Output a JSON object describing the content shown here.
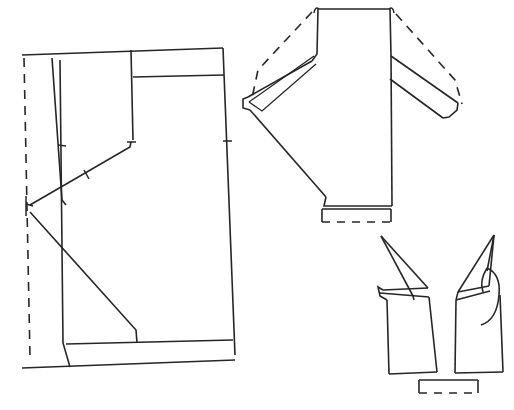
{
  "document": {
    "title": "Garment Pattern Line Drawing",
    "type": "technical-flat-sketch",
    "background_color": "#ffffff",
    "line_color": "#262626",
    "canvas": {
      "width": 514,
      "height": 410
    }
  },
  "legend": {
    "solid_line_meaning": "cut line / garment outline",
    "dashed_line_meaning": "fold line / hidden construction line",
    "notch_meaning": "alignment notch mark"
  },
  "pieces": [
    {
      "id": "piece-left-panel",
      "label": "Left panel with yoke and diagonal seams",
      "position": "left",
      "geometry": {
        "outline": "M 22,55 L 223,48 L 235,355 L 22,368 Z",
        "fold_line": "M 24,58 L 30,357",
        "top_edge": "M 22,55 L 223,48",
        "right_edge": "M 223,48 L 235,355",
        "bottom_edge": "M 22,368 L 235,360",
        "hem_line": "M 66,344 L 233,340",
        "side_seam": "M 70,367 L 63,343 L 60,60",
        "dart_left": "M 52,58 L 62,200 L 66,205",
        "diagonal_upper": "M 30,205 L 130,147 L 131,142",
        "diagonal_lower": "M 30,212 L 136,330 L 137,343",
        "yoke_vertical": "M 131,50 L 133,140",
        "yoke_horizontal": "M 133,77 L 224,75",
        "center_vertical": "M 136,145 L 136,146"
      },
      "notches": [
        {
          "at": "left-dart",
          "x": 62,
          "y": 145
        },
        {
          "at": "lower-diagonal",
          "x": 86,
          "y": 175
        },
        {
          "at": "right-edge",
          "x": 228,
          "y": 141
        }
      ]
    },
    {
      "id": "piece-bodice-sleeves",
      "label": "Bodice front with two sleeves and hem band",
      "position": "top-right",
      "geometry": {
        "body_outline": "M 318,8 L 390,8 L 392,205 L 323,205 Z",
        "left_shoulder": "M 318,8 L 316,52 L 312,60",
        "left_sleeve_top": "M 312,60 L 247,98",
        "left_sleeve_cuff": "M 247,98 L 243,105 L 252,110",
        "left_sleeve_under": "M 252,110 L 326,196",
        "left_underarm_inner": "M 314,58 L 249,104",
        "left_inner_sleeve_seam": "M 252,108 L 316,65",
        "right_shoulder": "M 390,8 L 392,55",
        "right_sleeve_top": "M 392,55 L 457,103",
        "right_sleeve_cuff": "M 457,103 L 450,112 L 443,118",
        "right_sleeve_under": "M 443,118 L 390,78",
        "right_body_seam": "M 390,78 L 392,205",
        "left_dashed_sleeve": "M 312,12 L 258,70 L 252,98",
        "right_dashed_sleeve": "M 396,14 L 455,80 L 462,104",
        "hem_band": "M 322,206 L 322,222 L 390,222 L 390,206",
        "hem_band_dashed": "M 322,222 L 390,222"
      },
      "notches": [
        {
          "at": "left-shoulder-corner",
          "x": 318,
          "y": 10
        },
        {
          "at": "right-shoulder-corner",
          "x": 390,
          "y": 10
        }
      ]
    },
    {
      "id": "piece-trousers",
      "label": "Trouser legs with waist flaps and hem band",
      "position": "bottom-right",
      "geometry": {
        "left_leg_outline": "M 382,293 L 388,374 L 437,372 L 428,295 L 414,297",
        "left_flap": "M 380,235 L 428,289 L 388,292 Z",
        "left_flap_top": "M 380,235 L 428,289",
        "left_flap_tip": "M 380,286 L 386,292 L 380,294",
        "left_inner_seam": "M 386,292 L 428,295",
        "left_crotch": "M 380,288 L 429,297",
        "right_leg_outline": "M 460,296 L 455,373 L 503,372 L 500,292",
        "right_flap": "M 493,234 L 457,292 L 497,286 Z",
        "right_flap_edge": "M 493,234 L 457,292",
        "right_curve": "M 489,270 Q 502,276 498,296 Q 494,318 480,323",
        "right_inner": "M 497,286 L 460,296",
        "hem_band": "M 419,379 L 419,394 L 478,394 L 478,379",
        "hem_band_dashed": "M 419,394 L 478,394"
      },
      "notches": []
    }
  ]
}
